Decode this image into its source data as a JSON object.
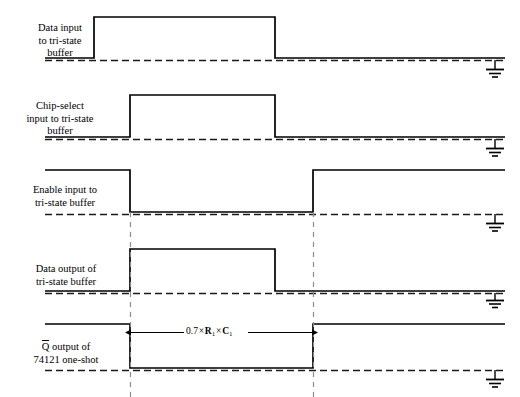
{
  "diagram": {
    "type": "timing-diagram",
    "width": 520,
    "height": 397,
    "colors": {
      "waveform": "#000000",
      "baseline_dashed": "#1a1a1a",
      "guide_dashed": "#8c8c8c",
      "background": "#ffffff"
    },
    "geometry": {
      "wave_left": 45,
      "wave_right": 505,
      "guide_lines_x": [
        130,
        313
      ],
      "ground_x": 495
    },
    "signals": [
      {
        "id": "data-input",
        "label_lines": "Data input\nto tri-state\nbuffer",
        "label": "Data input to tri-state buffer",
        "initial_level": "low",
        "high_y": 17,
        "low_y": 58,
        "transitions": [
          {
            "x": 94,
            "to": "high"
          },
          {
            "x": 275,
            "to": "low"
          }
        ],
        "has_ground": true,
        "ground_y": 63
      },
      {
        "id": "chip-select-input",
        "label_lines": "Chip-select\ninput to tri-state\nbuffer",
        "label": "Chip-select input to tri-state buffer",
        "initial_level": "low",
        "high_y": 95,
        "low_y": 137,
        "transitions": [
          {
            "x": 130,
            "to": "high"
          },
          {
            "x": 275,
            "to": "low"
          }
        ],
        "has_ground": true,
        "ground_y": 142
      },
      {
        "id": "enable-input",
        "label_lines": "Enable input to\ntri-state buffer",
        "label": "Enable input to tri-state buffer",
        "initial_level": "high",
        "high_y": 170,
        "low_y": 212,
        "transitions": [
          {
            "x": 130,
            "to": "low"
          },
          {
            "x": 313,
            "to": "high"
          }
        ],
        "has_ground": true,
        "ground_y": 217
      },
      {
        "id": "data-output",
        "label_lines": "Data output of\ntri-state buffer",
        "label": "Data output of tri-state buffer",
        "initial_level": "low",
        "high_y": 249,
        "low_y": 291,
        "transitions": [
          {
            "x": 130,
            "to": "high"
          },
          {
            "x": 275,
            "to": "low"
          }
        ],
        "has_ground": true,
        "ground_y": 296
      },
      {
        "id": "qbar-output",
        "label_lines": "Q̄ output of\n74121 one-shot",
        "label": "Q-bar output of 74121 one-shot",
        "label_overbar_char": "Q",
        "label_rest_line1": " output of",
        "label_line2": "74121 one-shot",
        "initial_level": "high",
        "high_y": 324,
        "low_y": 368,
        "transitions": [
          {
            "x": 130,
            "to": "low"
          },
          {
            "x": 313,
            "to": "high"
          }
        ],
        "has_ground": true,
        "ground_y": 373
      }
    ],
    "annotation": {
      "id": "pulse-width-annotation",
      "text": "0.7 × R₁ × C₁",
      "coefficient": "0.7",
      "multiply_symbol": "×",
      "resistor": "R",
      "resistor_sub": "1",
      "capacitor": "C",
      "capacitor_sub": "1",
      "arrow_y": 332,
      "arrow_x_start": 130,
      "arrow_x_end": 313,
      "text_x": 185,
      "text_y": 326
    }
  }
}
